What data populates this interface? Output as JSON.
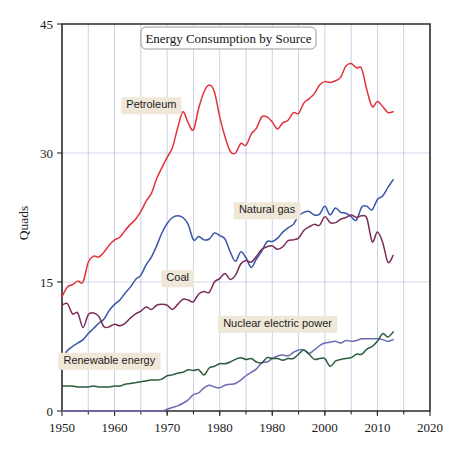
{
  "chart_data": {
    "type": "line",
    "title": "Energy Consumption by Source",
    "xlabel": "",
    "ylabel": "Quads",
    "xlim": [
      1950,
      2020
    ],
    "ylim": [
      0,
      45
    ],
    "xticks": [
      1950,
      1960,
      1970,
      1980,
      1980,
      2000,
      2010,
      2020
    ],
    "xtick_labels": [
      "1950",
      "1960",
      "1970",
      "1980",
      "1980",
      "2000",
      "2010",
      "2020"
    ],
    "yticks": [
      0,
      15,
      30,
      45
    ],
    "ytick_labels": [
      "0",
      "15",
      "30",
      "45"
    ],
    "grid": "vertical-and-horizontal",
    "legend": "inline-labels",
    "x": [
      1950,
      1951,
      1952,
      1953,
      1954,
      1955,
      1956,
      1957,
      1958,
      1959,
      1960,
      1961,
      1962,
      1963,
      1964,
      1965,
      1966,
      1967,
      1968,
      1969,
      1970,
      1971,
      1972,
      1973,
      1974,
      1975,
      1976,
      1977,
      1978,
      1979,
      1980,
      1981,
      1982,
      1983,
      1984,
      1985,
      1986,
      1987,
      1988,
      1989,
      1990,
      1991,
      1992,
      1993,
      1994,
      1995,
      1996,
      1997,
      1998,
      1999,
      2000,
      2001,
      2002,
      2003,
      2004,
      2005,
      2006,
      2007,
      2008,
      2009,
      2010,
      2011,
      2012,
      2013
    ],
    "series": [
      {
        "name": "Petroleum",
        "color": "#e0343c",
        "label_x": 1967,
        "label_y": 35.6,
        "values": [
          13.3,
          14.4,
          14.7,
          15.1,
          15.0,
          17.3,
          18.0,
          17.9,
          18.5,
          19.3,
          19.9,
          20.2,
          21.0,
          21.7,
          22.3,
          23.2,
          24.4,
          25.3,
          27.0,
          28.3,
          29.5,
          30.6,
          32.9,
          34.8,
          33.5,
          32.7,
          35.2,
          37.1,
          37.9,
          37.1,
          34.2,
          31.9,
          30.2,
          30.0,
          31.1,
          30.9,
          32.2,
          32.9,
          34.2,
          34.2,
          33.6,
          32.8,
          33.5,
          33.8,
          34.7,
          34.6,
          35.8,
          36.3,
          36.9,
          37.9,
          38.3,
          38.2,
          38.4,
          38.8,
          40.1,
          40.4,
          39.9,
          39.8,
          37.3,
          35.4,
          36.0,
          35.4,
          34.7,
          34.8
        ]
      },
      {
        "name": "Natural gas",
        "color": "#3a56a8",
        "label_x": 1989,
        "label_y": 23.4,
        "values": [
          6.0,
          7.0,
          7.5,
          7.9,
          8.3,
          9.0,
          9.6,
          10.2,
          10.7,
          11.7,
          12.4,
          12.9,
          13.7,
          14.4,
          15.3,
          15.8,
          17.0,
          17.9,
          19.2,
          20.7,
          21.8,
          22.5,
          22.7,
          22.5,
          21.7,
          19.9,
          20.3,
          19.9,
          20.0,
          20.7,
          20.4,
          20.0,
          18.5,
          17.4,
          18.5,
          17.8,
          16.7,
          17.7,
          18.6,
          19.7,
          19.7,
          20.1,
          20.8,
          21.3,
          21.7,
          22.7,
          23.1,
          23.2,
          22.8,
          22.9,
          23.8,
          22.8,
          23.6,
          23.1,
          23.0,
          22.6,
          22.2,
          23.7,
          23.8,
          23.4,
          24.6,
          25.0,
          26.0,
          26.9
        ]
      },
      {
        "name": "Coal",
        "color": "#7b2d57",
        "label_x": 1972,
        "label_y": 15.5,
        "values": [
          12.3,
          12.5,
          11.3,
          11.4,
          9.7,
          11.2,
          11.4,
          11.0,
          9.8,
          9.8,
          10.1,
          9.9,
          10.2,
          10.8,
          11.3,
          11.6,
          12.1,
          11.8,
          12.3,
          12.4,
          12.3,
          11.8,
          12.4,
          13.0,
          12.9,
          12.7,
          13.6,
          13.9,
          13.8,
          15.0,
          15.4,
          16.0,
          15.3,
          15.8,
          17.1,
          17.5,
          17.3,
          18.0,
          18.8,
          19.1,
          19.2,
          18.8,
          19.1,
          19.8,
          19.9,
          20.1,
          21.0,
          21.4,
          21.7,
          21.6,
          22.6,
          21.9,
          21.9,
          22.3,
          22.5,
          22.8,
          22.5,
          22.7,
          22.4,
          19.7,
          20.8,
          19.6,
          17.3,
          18.1
        ]
      },
      {
        "name": "Nuclear electric power",
        "color": "#6d6bb4",
        "label_x": 1991,
        "label_y": 10.2,
        "values": [
          0.0,
          0.0,
          0.0,
          0.0,
          0.0,
          0.0,
          0.0,
          0.0,
          0.0,
          0.0,
          0.0,
          0.0,
          0.0,
          0.0,
          0.0,
          0.0,
          0.0,
          0.0,
          0.0,
          0.0,
          0.2,
          0.4,
          0.6,
          0.9,
          1.3,
          1.9,
          2.1,
          2.7,
          3.0,
          2.8,
          2.7,
          3.0,
          3.1,
          3.2,
          3.6,
          4.1,
          4.5,
          4.9,
          5.6,
          5.7,
          6.1,
          6.4,
          6.5,
          6.4,
          6.8,
          7.1,
          7.1,
          6.7,
          7.1,
          7.6,
          7.9,
          8.0,
          8.1,
          7.9,
          8.2,
          8.1,
          8.2,
          8.4,
          8.4,
          8.4,
          8.4,
          8.3,
          8.1,
          8.3
        ]
      },
      {
        "name": "Renewable energy",
        "color": "#2c5b3c",
        "label_x": 1959,
        "label_y": 5.9,
        "values": [
          2.9,
          2.9,
          2.9,
          2.8,
          2.8,
          2.8,
          2.9,
          2.8,
          2.8,
          2.8,
          2.9,
          2.9,
          3.1,
          3.2,
          3.3,
          3.4,
          3.5,
          3.6,
          3.6,
          3.7,
          4.1,
          4.2,
          4.4,
          4.5,
          4.8,
          4.7,
          4.8,
          4.2,
          5.0,
          5.2,
          5.5,
          5.5,
          5.7,
          6.0,
          6.2,
          6.0,
          6.1,
          5.7,
          5.6,
          6.2,
          6.1,
          6.1,
          5.9,
          6.1,
          6.1,
          6.6,
          7.1,
          6.6,
          6.0,
          6.1,
          6.1,
          5.2,
          5.8,
          6.0,
          6.1,
          6.2,
          6.6,
          6.6,
          7.2,
          7.5,
          8.1,
          9.0,
          8.6,
          9.2
        ]
      }
    ]
  }
}
